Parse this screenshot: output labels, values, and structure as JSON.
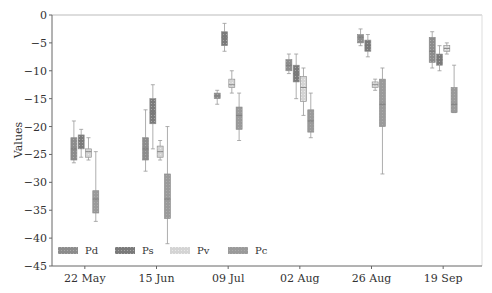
{
  "chart_data": {
    "type": "box",
    "title": "",
    "xlabel": "",
    "ylabel": "Values",
    "ylim": [
      -45,
      0
    ],
    "yticks": [
      0,
      -5,
      -10,
      -15,
      -20,
      -25,
      -30,
      -35,
      -40,
      -45
    ],
    "ytick_labels": [
      "0",
      "−5",
      "−10",
      "−15",
      "−20",
      "−25",
      "−30",
      "−35",
      "−40",
      "−45"
    ],
    "categories": [
      "22 May",
      "15 Jun",
      "09 Jul",
      "02 Aug",
      "26 Aug",
      "19 Sep"
    ],
    "grid": false,
    "legend_position": "lower left",
    "series": [
      {
        "name": "Pd",
        "color": "#8c8c8c",
        "stats_format": [
          "whisker_low",
          "q1",
          "median",
          "q3",
          "whisker_high"
        ],
        "values": [
          [
            -26.5,
            -26,
            -24,
            -22,
            -19
          ],
          [
            -28,
            -26,
            -24,
            -22,
            -17
          ],
          [
            -16,
            -15,
            -14.5,
            -14,
            -13.5
          ],
          [
            -10.5,
            -10,
            -9,
            -8,
            -7
          ],
          [
            -5.5,
            -5,
            -4,
            -3.5,
            -2.5
          ],
          [
            -9.5,
            -8.5,
            -6.5,
            -4,
            -3
          ]
        ]
      },
      {
        "name": "Ps",
        "color": "#7a7a7a",
        "stats_format": [
          "whisker_low",
          "q1",
          "median",
          "q3",
          "whisker_high"
        ],
        "values": [
          [
            -25.5,
            -24,
            -22.5,
            -21.5,
            -20.5
          ],
          [
            -24,
            -19.5,
            -17.5,
            -15,
            -12.5
          ],
          [
            -6.5,
            -5.5,
            -4,
            -3,
            -1.5
          ],
          [
            -15,
            -12,
            -10.5,
            -9,
            -7
          ],
          [
            -7.5,
            -6.5,
            -5.5,
            -4.5,
            -3.5
          ],
          [
            -10,
            -9,
            -8,
            -7,
            -5.5
          ]
        ]
      },
      {
        "name": "Pv",
        "color": "#d4d4d4",
        "stats_format": [
          "whisker_low",
          "q1",
          "median",
          "q3",
          "whisker_high"
        ],
        "values": [
          [
            -26,
            -25.5,
            -24.5,
            -24,
            -22
          ],
          [
            -26,
            -25.5,
            -24.5,
            -23.5,
            -22.5
          ],
          [
            -14,
            -13,
            -12.5,
            -11.5,
            -10
          ],
          [
            -18,
            -15.5,
            -13,
            -11,
            -9.5
          ],
          [
            -13.5,
            -13,
            -12.5,
            -12,
            -11.5
          ],
          [
            -7,
            -6.5,
            -6,
            -5.5,
            -5
          ]
        ]
      },
      {
        "name": "Pc",
        "color": "#9a9a9a",
        "stats_format": [
          "whisker_low",
          "q1",
          "median",
          "q3",
          "whisker_high"
        ],
        "values": [
          [
            -37,
            -35.5,
            -33,
            -31.5,
            -24.5
          ],
          [
            -41,
            -36.5,
            -33,
            -28.5,
            -20
          ],
          [
            -22.5,
            -20.5,
            -18,
            -16.5,
            -14
          ],
          [
            -22,
            -21,
            -19,
            -17,
            -14
          ],
          [
            -28.5,
            -20,
            -16,
            -11.5,
            -9.5
          ],
          [
            -17.5,
            -17.5,
            -16,
            -13,
            -9
          ]
        ]
      }
    ]
  }
}
